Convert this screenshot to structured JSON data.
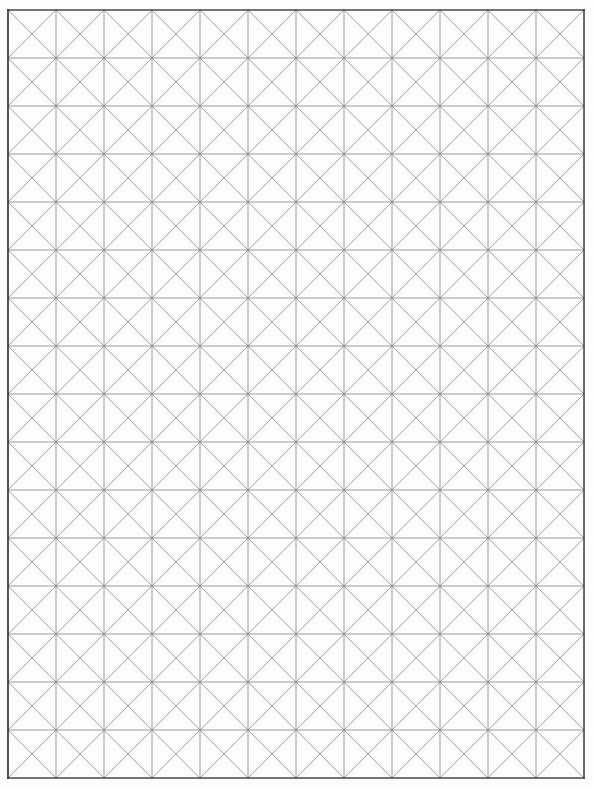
{
  "document": {
    "kind": "graph-paper-sheet",
    "title": "Cross-hatched square grid graph paper",
    "description": "Blank scanned sheet of graph paper ruled into square cells, each cell crossed by both diagonals forming an X pattern.",
    "page_width": 595,
    "page_height": 789,
    "has_text": false,
    "text_content": ""
  },
  "chart_data": {
    "type": "grid",
    "title": "",
    "xlabel": "",
    "ylabel": "",
    "grid": true,
    "legend": "none",
    "columns": 12,
    "rows": 16,
    "cell_width": 48,
    "cell_height": 48,
    "cell_diagonals": "both",
    "origin_x": 8,
    "origin_y": 10,
    "grid_width": 576,
    "grid_height": 768,
    "vertical_line_x": [
      8,
      56,
      104,
      152,
      200,
      248,
      296,
      344,
      392,
      440,
      488,
      536,
      584
    ],
    "horizontal_line_y": [
      10,
      58,
      106,
      154,
      202,
      250,
      298,
      346,
      394,
      442,
      490,
      538,
      586,
      634,
      682,
      730,
      778
    ],
    "total_cells": 192,
    "total_x_crosses": 192,
    "annotations": []
  },
  "style": {
    "background_color": "#fdfdfd",
    "paper_color": "#ffffff",
    "border_color": "#3c3c3c",
    "gridline_color": "#8a8a8a",
    "diagonal_color": "#7e7e7e",
    "border_width": 1.6,
    "gridline_width": 0.9,
    "diagonal_width": 0.8
  },
  "labels": {
    "sheet_name": "Graph Paper",
    "grid_region": "grid-area",
    "border_frame": "outer-border"
  }
}
